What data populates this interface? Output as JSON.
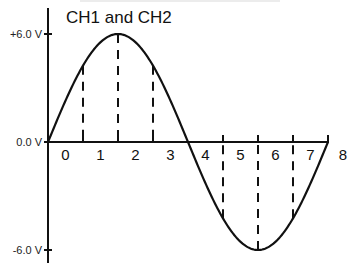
{
  "chart_data": {
    "type": "line",
    "title": "CH1 and CH2",
    "xlabel": "",
    "ylabel": "",
    "x_tick_labels": [
      "0",
      "1",
      "2",
      "3",
      "4",
      "5",
      "6",
      "7",
      "8"
    ],
    "y_tick_labels": [
      "+6.0 V",
      "0.0 V",
      "-6.0 V"
    ],
    "y_ticks": [
      6.0,
      0.0,
      -6.0
    ],
    "xlim": [
      0,
      8
    ],
    "ylim": [
      -6.0,
      6.0
    ],
    "grid": false,
    "legend": null,
    "series": [
      {
        "name": "CH1 and CH2 sine waveform",
        "description": "One full sine period over 8 divisions, amplitude 6.0 V",
        "amplitude_v": 6.0,
        "period_divisions": 8,
        "x": [
          0,
          1,
          2,
          3,
          4,
          5,
          6,
          7,
          8
        ],
        "values": [
          0.0,
          4.24,
          6.0,
          4.24,
          0.0,
          -4.24,
          -6.0,
          -4.24,
          0.0
        ]
      }
    ],
    "annotations": [
      {
        "type": "dashed-vertical",
        "x": 1,
        "y": 4.24
      },
      {
        "type": "dashed-vertical",
        "x": 2,
        "y": 6.0
      },
      {
        "type": "dashed-vertical",
        "x": 3,
        "y": 4.24
      },
      {
        "type": "dashed-vertical",
        "x": 5,
        "y": -4.24
      },
      {
        "type": "dashed-vertical",
        "x": 6,
        "y": -6.0
      },
      {
        "type": "dashed-vertical",
        "x": 7,
        "y": -4.24
      }
    ],
    "colors": {
      "line": "#111111",
      "axis": "#111111",
      "background": "#ffffff"
    }
  }
}
